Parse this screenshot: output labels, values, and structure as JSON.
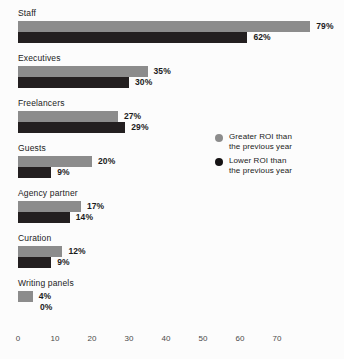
{
  "chart_data": {
    "type": "bar",
    "orientation": "horizontal",
    "title": "",
    "subtitle": "",
    "xlabel": "",
    "ylabel": "",
    "xlim": [
      0,
      79
    ],
    "grid": false,
    "legend_position": "right",
    "categories": [
      "Staff",
      "Executives",
      "Freelancers",
      "Guests",
      "Agency partner",
      "Curation",
      "Writing panels"
    ],
    "series": [
      {
        "name": "Greater ROI than the previous year",
        "color": "#8c8c8c",
        "values": [
          79,
          35,
          27,
          20,
          17,
          12,
          4
        ],
        "labels": [
          "79%",
          "35%",
          "27%",
          "20%",
          "17%",
          "12%",
          "4%"
        ]
      },
      {
        "name": "Lower ROI than the previous year",
        "color": "#231f20",
        "values": [
          62,
          30,
          29,
          9,
          14,
          9,
          0
        ],
        "labels": [
          "62%",
          "30%",
          "29%",
          "9%",
          "14%",
          "9%",
          "0%"
        ]
      }
    ],
    "xticks": [
      0,
      10,
      20,
      30,
      40,
      50,
      60,
      70
    ],
    "xtick_labels": [
      "0",
      "10",
      "20",
      "30",
      "40",
      "50",
      "60",
      "70"
    ]
  },
  "legend": {
    "items": [
      {
        "swatch": "greater-roi-dot",
        "label": "Greater ROI than\nthe previous year",
        "color": "#8c8c8c"
      },
      {
        "swatch": "lower-roi-dot",
        "label": "Lower ROI than\nthe previous year",
        "color": "#151314"
      }
    ]
  },
  "colors": {
    "background": "#fcfcfc",
    "greater": "#8c8c8c",
    "lower": "#231f20",
    "text": "#1b1b1b",
    "axis_text": "#4a4a4a"
  }
}
